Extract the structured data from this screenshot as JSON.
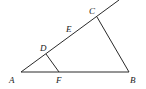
{
  "diagram": {
    "type": "geometry-triangle",
    "stroke_color": "#2a2a2a",
    "points": {
      "A": {
        "label": "A",
        "x": 21,
        "y": 72
      },
      "B": {
        "label": "B",
        "x": 129,
        "y": 72
      },
      "C": {
        "label": "C",
        "x": 97,
        "y": 17
      },
      "D": {
        "label": "D",
        "x": 46,
        "y": 54
      },
      "E": {
        "label": "E"
      },
      "F": {
        "label": "F",
        "x": 59,
        "y": 72
      }
    },
    "segments": [
      "A-B",
      "B-C",
      "A-C (ray extended past C)",
      "D-F"
    ]
  }
}
